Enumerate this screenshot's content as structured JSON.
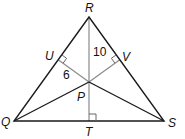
{
  "diagram": {
    "type": "triangle-incenter",
    "vertices": {
      "R": {
        "label": "R",
        "x": 89,
        "y": 17
      },
      "Q": {
        "label": "Q",
        "x": 14,
        "y": 121
      },
      "S": {
        "label": "S",
        "x": 164,
        "y": 121
      }
    },
    "points": {
      "P": {
        "label": "P",
        "x": 89,
        "y": 82
      },
      "U": {
        "label": "U",
        "x": 58.2,
        "y": 59.7
      },
      "V": {
        "label": "V",
        "x": 119.8,
        "y": 59.7
      },
      "T": {
        "label": "T",
        "x": 89,
        "y": 121
      }
    },
    "measures": {
      "RP": "10",
      "PU": "6"
    },
    "right_angles": [
      "U",
      "V",
      "T"
    ],
    "colors": {
      "triangle": "#1a1a1a",
      "bisector": "#1a1a1a",
      "perpendicular": "#8a8a8a"
    }
  }
}
